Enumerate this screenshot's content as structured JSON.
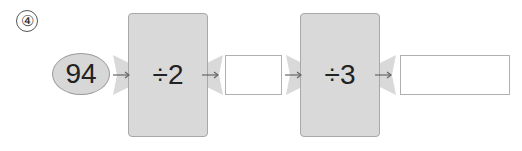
{
  "problem_label": "④",
  "input_value": "94",
  "machines": [
    {
      "operation": "÷2"
    },
    {
      "operation": "÷3"
    }
  ],
  "outputs": [
    {
      "value": ""
    },
    {
      "value": ""
    }
  ],
  "colors": {
    "machine_fill": "#d9d9d9",
    "ellipse_fill": "#d7d7d7",
    "arrow": "#666666"
  }
}
